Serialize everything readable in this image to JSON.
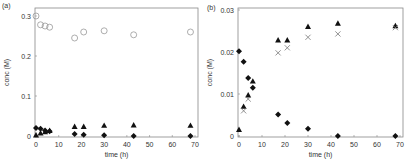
{
  "chart_data": [
    {
      "type": "scatter",
      "panel_label": "(a)",
      "title": "",
      "xlabel": "time (h)",
      "ylabel": "conc (M)",
      "xlim": [
        0,
        70
      ],
      "ylim": [
        0,
        0.3
      ],
      "xticks": [
        "0",
        "10",
        "20",
        "30",
        "40",
        "50",
        "60",
        "70"
      ],
      "yticks": [
        "0",
        "0.1",
        "0.2",
        "0.3"
      ],
      "grid": false,
      "legend": "none",
      "series": [
        {
          "name": "open-circle",
          "marker": "circle-open",
          "x": [
            0,
            2,
            4,
            6,
            17,
            21,
            30,
            43,
            68
          ],
          "y": [
            0.3,
            0.278,
            0.275,
            0.272,
            0.245,
            0.26,
            0.263,
            0.253,
            0.26
          ]
        },
        {
          "name": "filled-triangle",
          "marker": "triangle-filled",
          "x": [
            0,
            2,
            4,
            6,
            17,
            21,
            30,
            43,
            68
          ],
          "y": [
            0.002,
            0.007,
            0.01,
            0.013,
            0.023,
            0.023,
            0.026,
            0.027,
            0.026
          ]
        },
        {
          "name": "filled-diamond",
          "marker": "diamond-filled",
          "x": [
            0,
            2,
            4,
            6,
            17,
            21,
            30,
            43,
            68
          ],
          "y": [
            0.02,
            0.018,
            0.014,
            0.012,
            0.005,
            0.003,
            0.002,
            0.0,
            0.0
          ]
        }
      ]
    },
    {
      "type": "scatter",
      "panel_label": "(b)",
      "title": "",
      "xlabel": "time (h)",
      "ylabel": "conc (M)",
      "xlim": [
        0,
        70
      ],
      "ylim": [
        0,
        0.03
      ],
      "xticks": [
        "0",
        "10",
        "20",
        "30",
        "40",
        "50",
        "60",
        "70"
      ],
      "yticks": [
        "0",
        "0.01",
        "0.02",
        "0.03"
      ],
      "grid": false,
      "legend": "none",
      "series": [
        {
          "name": "filled-triangle",
          "marker": "triangle-filled",
          "x": [
            0,
            2,
            4,
            6,
            17,
            21,
            30,
            43,
            68
          ],
          "y": [
            0.0015,
            0.007,
            0.0097,
            0.013,
            0.0228,
            0.0228,
            0.026,
            0.0268,
            0.0262
          ]
        },
        {
          "name": "cross",
          "marker": "x",
          "x": [
            2,
            4,
            17,
            21,
            30,
            43,
            68
          ],
          "y": [
            0.006,
            0.0088,
            0.0198,
            0.021,
            0.0235,
            0.0243,
            0.0258
          ]
        },
        {
          "name": "filled-diamond",
          "marker": "diamond-filled",
          "x": [
            0,
            2,
            4,
            6,
            17,
            21,
            30,
            43,
            68
          ],
          "y": [
            0.0202,
            0.0177,
            0.0138,
            0.0115,
            0.0051,
            0.0031,
            0.0017,
            0.0,
            0.0
          ]
        }
      ]
    }
  ]
}
